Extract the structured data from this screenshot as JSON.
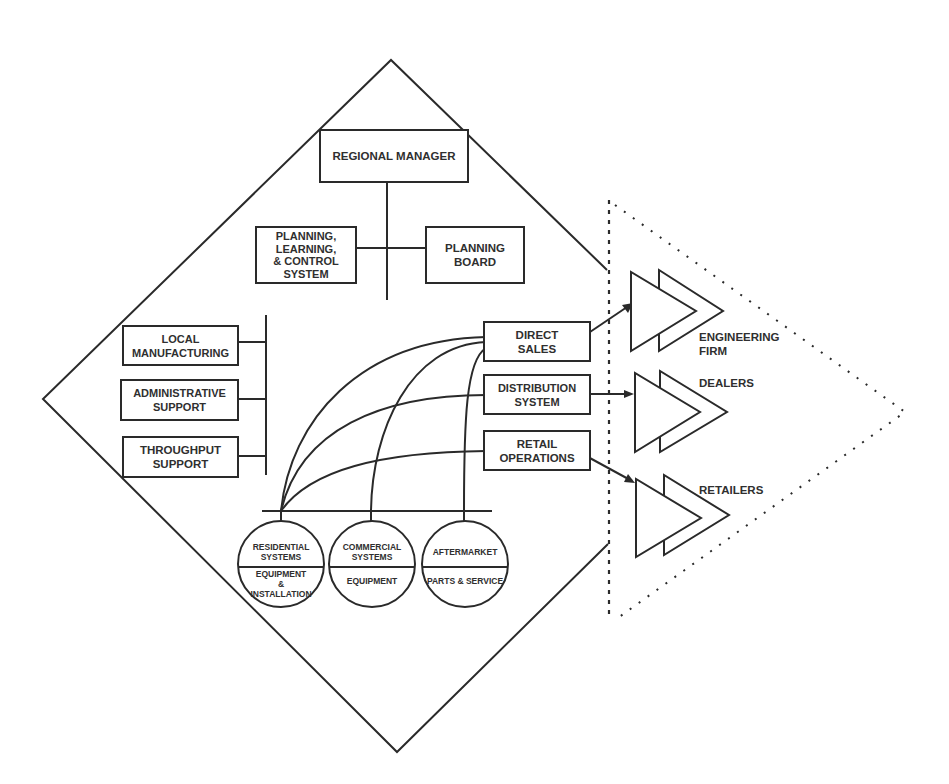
{
  "diagram": {
    "center": {
      "regional_manager": "REGIONAL MANAGER",
      "planning_system": "PLANNING,\nLEARNING,\n& CONTROL\nSYSTEM",
      "planning_board": "PLANNING\nBOARD"
    },
    "support": [
      {
        "label": "LOCAL\nMANUFACTURING"
      },
      {
        "label": "ADMINISTRATIVE\nSUPPORT"
      },
      {
        "label": "THROUGHPUT\nSUPPORT"
      }
    ],
    "channels": [
      {
        "label": "DIRECT\nSALES"
      },
      {
        "label": "DISTRIBUTION\nSYSTEM"
      },
      {
        "label": "RETAIL\nOPERATIONS"
      }
    ],
    "businesses": [
      {
        "top": "RESIDENTIAL\nSYSTEMS",
        "bottom": "EQUIPMENT\n&\nINSTALLATION"
      },
      {
        "top": "COMMERCIAL\nSYSTEMS",
        "bottom": "EQUIPMENT"
      },
      {
        "top": "AFTERMARKET",
        "bottom": "PARTS & SERVICE"
      }
    ],
    "customers": [
      {
        "label": "ENGINEERING\nFIRM"
      },
      {
        "label": "DEALERS"
      },
      {
        "label": "RETAILERS"
      }
    ]
  }
}
